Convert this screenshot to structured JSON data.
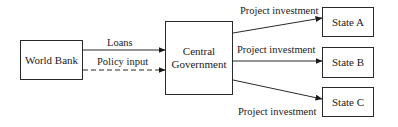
{
  "diagram": {
    "type": "flow",
    "nodes": [
      {
        "id": "world_bank",
        "label": "World Bank"
      },
      {
        "id": "central_government",
        "label": "Central Government",
        "line1": "Central",
        "line2": "Government"
      },
      {
        "id": "state_a",
        "label": "State A"
      },
      {
        "id": "state_b",
        "label": "State B"
      },
      {
        "id": "state_c",
        "label": "State C"
      }
    ],
    "edges": [
      {
        "from": "world_bank",
        "to": "central_government",
        "label": "Loans",
        "style": "solid"
      },
      {
        "from": "world_bank",
        "to": "central_government",
        "label": "Policy input",
        "style": "dashed"
      },
      {
        "from": "central_government",
        "to": "state_a",
        "label": "Project investment",
        "style": "solid"
      },
      {
        "from": "central_government",
        "to": "state_b",
        "label": "Project investment",
        "style": "solid"
      },
      {
        "from": "central_government",
        "to": "state_c",
        "label": "Project investment",
        "style": "solid"
      }
    ],
    "colors": {
      "line": "#2a2a2a",
      "background": "#ffffff"
    }
  }
}
